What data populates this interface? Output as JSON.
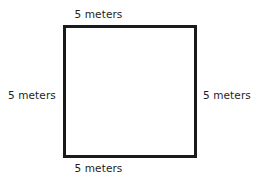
{
  "diagram": {
    "type": "geometry-figure",
    "shape": "square",
    "stroke_color": "#1a1a1a",
    "fill_color": "#ffffff",
    "background_color": "#ffffff",
    "labels": {
      "top": "5 meters",
      "right": "5 meters",
      "bottom": "5 meters",
      "left": "5 meters"
    },
    "side_length_value": "5",
    "side_length_unit": "meters"
  }
}
